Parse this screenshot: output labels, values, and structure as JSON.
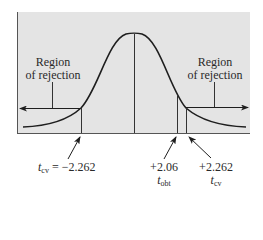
{
  "diagram": {
    "type": "t-distribution two-tailed rejection regions",
    "background_color": "#e4e4e4",
    "curve_color": "#1e1e1e",
    "left_region": {
      "line1": "Region",
      "line2": "of rejection"
    },
    "right_region": {
      "line1": "Region",
      "line2": "of rejection"
    },
    "left_critical": {
      "symbol": "t",
      "subscript": "cv",
      "equals": " = ",
      "value": "−2.262"
    },
    "obtained": {
      "value": "+2.06",
      "symbol": "t",
      "subscript": "obt"
    },
    "right_critical": {
      "value": "+2.262",
      "symbol": "t",
      "subscript": "cv"
    }
  }
}
